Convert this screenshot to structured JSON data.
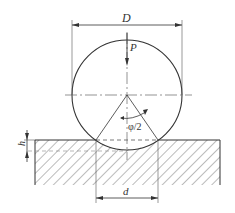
{
  "diagram": {
    "labels": {
      "ball_diameter": "D",
      "load": "P",
      "half_angle": "φ/2",
      "indent_depth": "h",
      "indent_diameter": "d"
    },
    "colors": {
      "line": "#333333",
      "hatch": "#555555",
      "background": "#ffffff"
    }
  }
}
